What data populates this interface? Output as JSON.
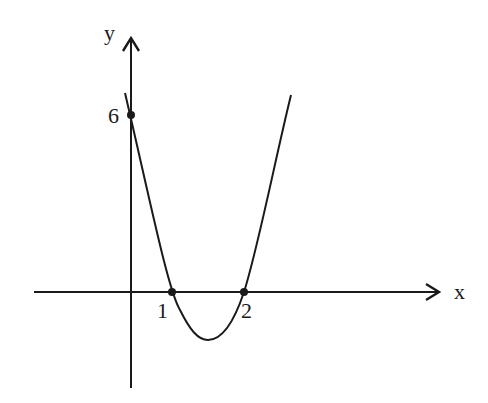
{
  "diagram": {
    "type": "function-graph",
    "axes": {
      "x_label": "x",
      "y_label": "y"
    },
    "points": [
      {
        "name": "y-intercept",
        "label": "6",
        "x": 0,
        "y": 6
      },
      {
        "name": "root-1",
        "label": "1",
        "x": 1,
        "y": 0
      },
      {
        "name": "root-2",
        "label": "2",
        "x": 2,
        "y": 0
      }
    ],
    "curve": {
      "kind": "parabola",
      "opens": "up",
      "roots": [
        1,
        2
      ],
      "y_intercept": 6
    },
    "colors": {
      "stroke": "#1a1a1a",
      "background": "#ffffff"
    }
  }
}
